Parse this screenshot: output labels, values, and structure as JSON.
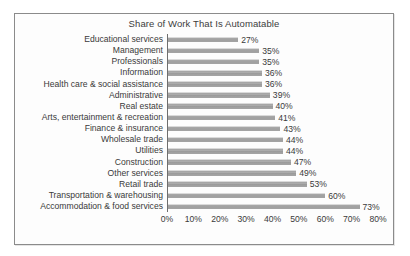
{
  "chart_data": {
    "type": "bar",
    "orientation": "horizontal",
    "title": "Share of Work That Is Automatable",
    "xlabel": "",
    "ylabel": "",
    "xlim": [
      0,
      80
    ],
    "grid": false,
    "legend": null,
    "xticks": [
      "0%",
      "10%",
      "20%",
      "30%",
      "40%",
      "50%",
      "60%",
      "70%",
      "80%"
    ],
    "xtick_values": [
      0,
      10,
      20,
      30,
      40,
      50,
      60,
      70,
      80
    ],
    "categories": [
      "Educational services",
      "Management",
      "Professionals",
      "Information",
      "Health care & social assistance",
      "Administrative",
      "Real estate",
      "Arts, entertainment & recreation",
      "Finance & insurance",
      "Wholesale trade",
      "Utilities",
      "Construction",
      "Other services",
      "Retail trade",
      "Transportation & warehousing",
      "Accommodation & food services"
    ],
    "values": [
      27,
      35,
      35,
      36,
      36,
      39,
      40,
      41,
      43,
      44,
      44,
      47,
      49,
      53,
      60,
      73
    ],
    "value_labels": [
      "27%",
      "35%",
      "35%",
      "36%",
      "36%",
      "39%",
      "40%",
      "41%",
      "43%",
      "44%",
      "44%",
      "47%",
      "49%",
      "53%",
      "60%",
      "73%"
    ],
    "bar_color": "#a2a2a2",
    "text_color": "#3a3a3a",
    "frame_color": "#8b8b8b",
    "background_color": "#fdfdfd"
  }
}
